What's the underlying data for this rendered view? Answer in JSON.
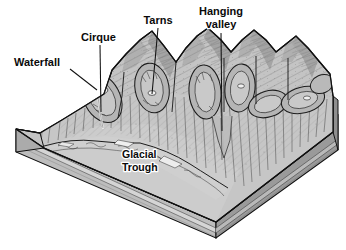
{
  "figure": {
    "type": "block-diagram",
    "style": "grayscale pen-and-ink textbook illustration",
    "background_color": "#ffffff",
    "canvas": {
      "width": 346,
      "height": 250
    }
  },
  "colors": {
    "outline": "#111111",
    "top_surface_light": "#c9c9c9",
    "top_surface_mid": "#b3b3b3",
    "ridge_shadow": "#8e8e8e",
    "valley_floor": "#c2c2c2",
    "block_face_left": "#bdbdbd",
    "block_face_right": "#9a9a9a",
    "strata_band": "#d6d6d6",
    "strata_dark": "#8a8a8a",
    "tarn_water": "#f2f2f2",
    "label_text": "#0a0a0a"
  },
  "labels": [
    {
      "id": "waterfall",
      "text": "Waterfall",
      "lines": [
        "Waterfall"
      ],
      "anchor": "start",
      "x": 14,
      "y": 66,
      "leader": {
        "x1": 70,
        "y1": 69,
        "x2": 97,
        "y2": 90
      }
    },
    {
      "id": "cirque",
      "text": "Cirque",
      "lines": [
        "Cirque"
      ],
      "anchor": "start",
      "x": 81,
      "y": 41,
      "leader": {
        "x1": 100,
        "y1": 45,
        "x2": 101,
        "y2": 112
      }
    },
    {
      "id": "tarns",
      "text": "Tarns",
      "lines": [
        "Tarns"
      ],
      "anchor": "middle",
      "x": 158,
      "y": 24,
      "leader": {
        "x1": 158,
        "y1": 28,
        "x2": 152,
        "y2": 94
      }
    },
    {
      "id": "hanging-valley",
      "text": "Hanging valley",
      "lines": [
        "Hanging",
        "valley"
      ],
      "anchor": "middle",
      "x": 221,
      "y": 15,
      "leader": {
        "x1": 221,
        "y1": 33,
        "x2": 222,
        "y2": 131
      }
    },
    {
      "id": "glacial-trough",
      "text": "Glacial Trough",
      "lines": [
        "Glacial",
        "Trough"
      ],
      "anchor": "start",
      "x": 122,
      "y": 158,
      "leader": null
    }
  ],
  "features": {
    "cirques_count": 7,
    "tarns_count": 3,
    "peaks_count": 6,
    "strata_layers": 3
  }
}
